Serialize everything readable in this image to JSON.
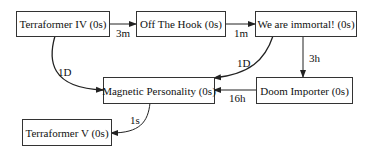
{
  "diagram": {
    "type": "directed-graph",
    "nodes": [
      {
        "id": "n1",
        "label": "Terraformer IV (0s)"
      },
      {
        "id": "n2",
        "label": "Off The Hook (0s)"
      },
      {
        "id": "n3",
        "label": "We are immortal! (0s)"
      },
      {
        "id": "n4",
        "label": "Magnetic Personality (0s)"
      },
      {
        "id": "n5",
        "label": "Doom Importer (0s)"
      },
      {
        "id": "n6",
        "label": "Terraformer V (0s)"
      }
    ],
    "edges": [
      {
        "from": "n1",
        "to": "n2",
        "label": "3m"
      },
      {
        "from": "n2",
        "to": "n3",
        "label": "1m"
      },
      {
        "from": "n1",
        "to": "n4",
        "label": "1D"
      },
      {
        "from": "n3",
        "to": "n4",
        "label": "1D"
      },
      {
        "from": "n3",
        "to": "n5",
        "label": "3h"
      },
      {
        "from": "n5",
        "to": "n4",
        "label": "16h"
      },
      {
        "from": "n4",
        "to": "n6",
        "label": "1s"
      }
    ],
    "colors": {
      "stroke": "#333333",
      "text": "#111111",
      "background": "#ffffff"
    }
  }
}
